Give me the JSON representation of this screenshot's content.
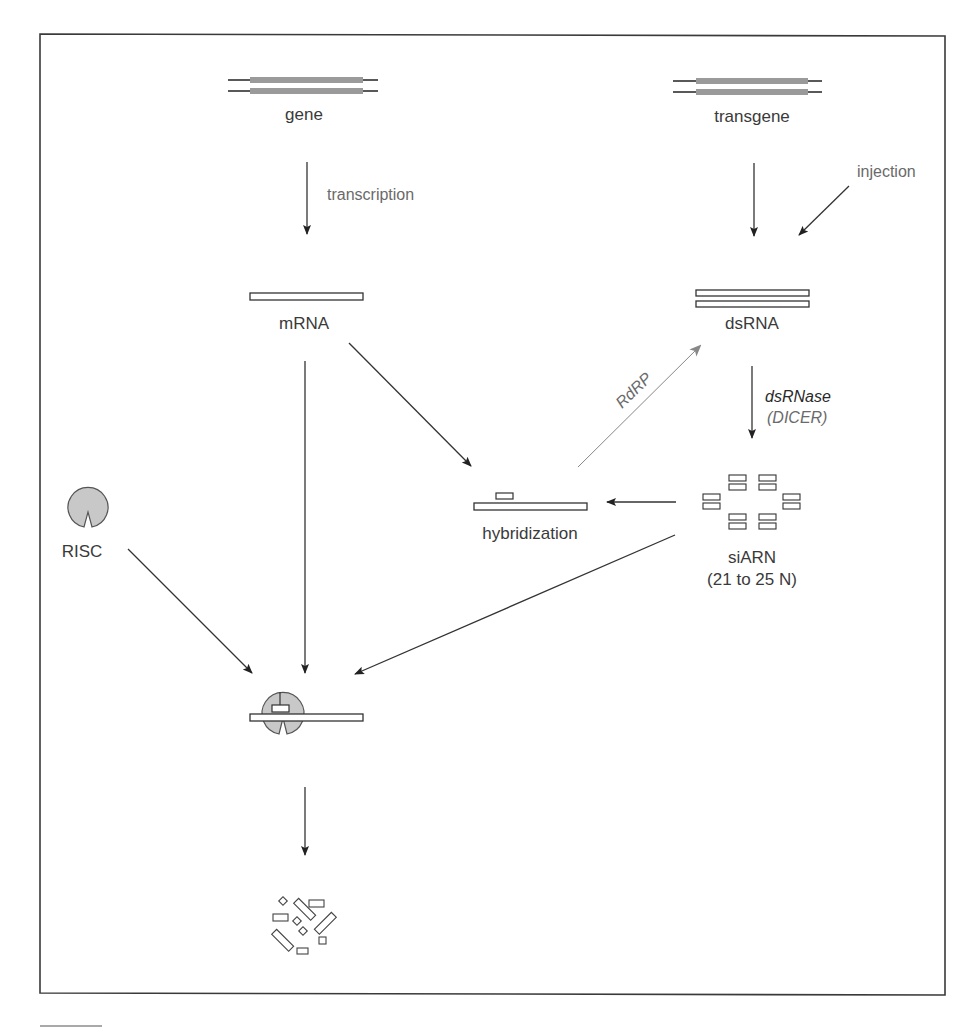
{
  "diagram": {
    "type": "flow",
    "title": "",
    "colors": {
      "line": "#333333",
      "light_line": "#777777",
      "gene_fill": "#9a9a9a",
      "risc_fill": "#c8c8c8",
      "text": "#3a3a3a",
      "text_grey": "#6a6a6a"
    },
    "nodes": {
      "gene": {
        "label": "gene"
      },
      "transgene": {
        "label": "transgene"
      },
      "mrna": {
        "label": "mRNA"
      },
      "dsrna": {
        "label": "dsRNA"
      },
      "hybridization": {
        "label": "hybridization"
      },
      "sirna": {
        "label": "siARN",
        "sublabel": "(21 to 25 N)"
      },
      "risc": {
        "label": "RISC"
      },
      "complex": {
        "label": ""
      },
      "degraded": {
        "label": ""
      }
    },
    "edges": {
      "transcription": {
        "from": "gene",
        "to": "mrna",
        "label": "transcription"
      },
      "transgene_to_dsrna": {
        "from": "transgene",
        "to": "dsrna",
        "label": ""
      },
      "injection": {
        "from": "outside",
        "to": "dsrna",
        "label": "injection"
      },
      "dicer": {
        "from": "dsrna",
        "to": "sirna",
        "label": "dsRNase",
        "sublabel": "(DICER)"
      },
      "rdrp": {
        "from": "hybridization",
        "to": "dsrna",
        "label": "RdRP"
      },
      "mrna_to_hybridization": {
        "from": "mrna",
        "to": "hybridization",
        "label": ""
      },
      "sirna_to_hybridization": {
        "from": "sirna",
        "to": "hybridization",
        "label": ""
      },
      "mrna_to_complex": {
        "from": "mrna",
        "to": "complex",
        "label": ""
      },
      "risc_to_complex": {
        "from": "risc",
        "to": "complex",
        "label": ""
      },
      "sirna_to_complex": {
        "from": "sirna",
        "to": "complex",
        "label": ""
      },
      "complex_to_degraded": {
        "from": "complex",
        "to": "degraded",
        "label": ""
      }
    }
  }
}
